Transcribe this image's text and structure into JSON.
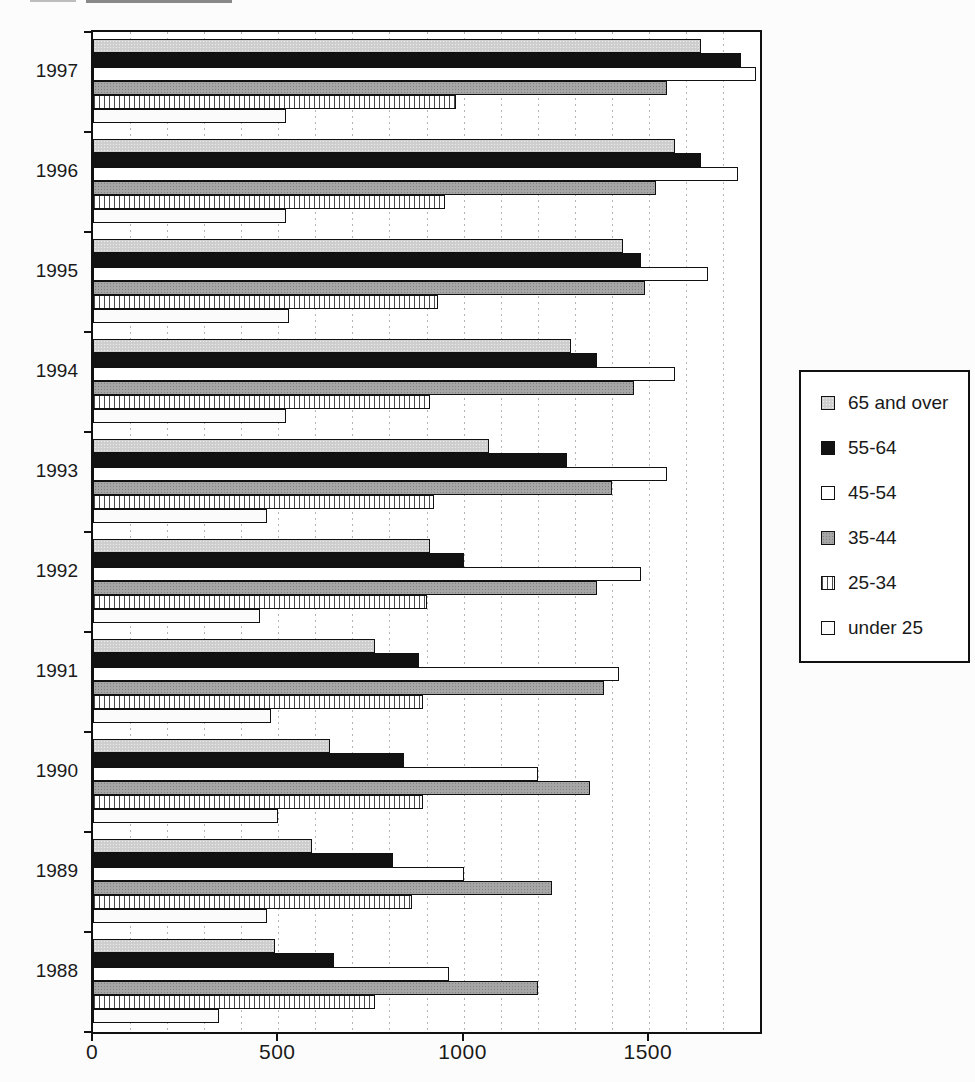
{
  "chart_data": {
    "type": "bar",
    "orientation": "horizontal",
    "title": "",
    "xlabel": "",
    "ylabel": "",
    "categories": [
      "1997",
      "1996",
      "1995",
      "1994",
      "1993",
      "1992",
      "1991",
      "1990",
      "1989",
      "1988"
    ],
    "series": [
      {
        "name": "65 and over",
        "pattern": "speckle-light",
        "fill": "#cecece",
        "values": [
          1640,
          1570,
          1430,
          1290,
          1070,
          910,
          760,
          640,
          590,
          490
        ]
      },
      {
        "name": "55-64",
        "pattern": "solid",
        "fill": "#121212",
        "values": [
          1750,
          1640,
          1480,
          1360,
          1280,
          1000,
          880,
          840,
          810,
          650
        ]
      },
      {
        "name": "45-54",
        "pattern": "solid",
        "fill": "#ffffff",
        "values": [
          1790,
          1740,
          1660,
          1570,
          1550,
          1480,
          1420,
          1200,
          1000,
          960
        ]
      },
      {
        "name": "35-44",
        "pattern": "speckle-dark",
        "fill": "#a6a6a6",
        "values": [
          1550,
          1520,
          1490,
          1460,
          1400,
          1360,
          1380,
          1340,
          1240,
          1200
        ]
      },
      {
        "name": "25-34",
        "pattern": "vertical-hatch",
        "fill": "#ffffff",
        "values": [
          980,
          950,
          930,
          910,
          920,
          900,
          890,
          890,
          860,
          760
        ]
      },
      {
        "name": "under 25",
        "pattern": "solid",
        "fill": "#fbfbfb",
        "values": [
          520,
          520,
          530,
          520,
          470,
          450,
          480,
          500,
          470,
          340
        ]
      }
    ],
    "xlim": [
      0,
      1800
    ],
    "x_ticks": [
      0,
      500,
      1000,
      1500
    ],
    "x_tick_labels": [
      "0",
      "500",
      "1000",
      "1500"
    ],
    "gridline_interval": 100,
    "grid": "vertical-dotted",
    "legend_position": "right",
    "legend_labels": [
      "65 and over",
      "55-64",
      "45-54",
      "35-44",
      "25-34",
      "under 25"
    ],
    "colors": {
      "axis": "#111111",
      "gridline": "#9a9a9a",
      "plot_bg": "#ffffff",
      "page_bg": "#fcfcfc"
    }
  }
}
